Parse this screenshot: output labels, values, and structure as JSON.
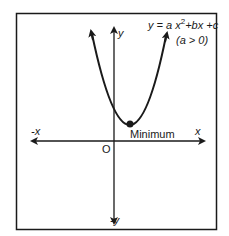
{
  "diagram": {
    "type": "parabola-graph",
    "equation": {
      "prefix": "y = a x",
      "exponent": "2",
      "suffix": "+bx +c"
    },
    "condition": "(a > 0)",
    "labels": {
      "y_pos": "y",
      "y_neg": "-y",
      "x_pos": "x",
      "x_neg": "-x",
      "origin": "O",
      "vertex": "Minimum"
    },
    "colors": {
      "line": "#1a1a1a",
      "background": "#ffffff"
    }
  }
}
